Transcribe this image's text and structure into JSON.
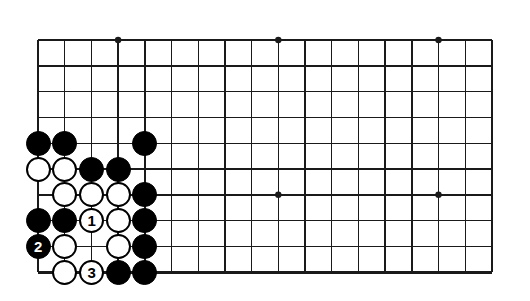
{
  "diagram": {
    "kind": "go-board-problem-diagram",
    "title": "",
    "board": {
      "cols": 18,
      "rows": 10,
      "spacing_x": 26.7,
      "spacing_y": 25.8,
      "origin_x": 38,
      "origin_y": 40,
      "edges": {
        "left": true,
        "top": true,
        "right": true,
        "bottom": true
      },
      "line_color": "#1a1a1a",
      "thin_line_width": 1.4,
      "edge_line_width": 2.6,
      "background": "#ffffff"
    },
    "star_points": [
      {
        "col": 3,
        "row": 0
      },
      {
        "col": 9,
        "row": 0
      },
      {
        "col": 15,
        "row": 0
      },
      {
        "col": 3,
        "row": 6
      },
      {
        "col": 9,
        "row": 6
      },
      {
        "col": 15,
        "row": 6
      }
    ],
    "stone_radius": 12.5,
    "stones": [
      {
        "col": 0,
        "row": 4,
        "color": "black",
        "label": ""
      },
      {
        "col": 1,
        "row": 4,
        "color": "black",
        "label": ""
      },
      {
        "col": 4,
        "row": 4,
        "color": "black",
        "label": ""
      },
      {
        "col": 0,
        "row": 5,
        "color": "white",
        "label": ""
      },
      {
        "col": 1,
        "row": 5,
        "color": "white",
        "label": ""
      },
      {
        "col": 2,
        "row": 5,
        "color": "black",
        "label": ""
      },
      {
        "col": 3,
        "row": 5,
        "color": "black",
        "label": ""
      },
      {
        "col": 1,
        "row": 6,
        "color": "white",
        "label": ""
      },
      {
        "col": 2,
        "row": 6,
        "color": "white",
        "label": ""
      },
      {
        "col": 3,
        "row": 6,
        "color": "white",
        "label": ""
      },
      {
        "col": 4,
        "row": 6,
        "color": "black",
        "label": ""
      },
      {
        "col": 0,
        "row": 7,
        "color": "black",
        "label": ""
      },
      {
        "col": 1,
        "row": 7,
        "color": "black",
        "label": ""
      },
      {
        "col": 2,
        "row": 7,
        "color": "white",
        "label": "1"
      },
      {
        "col": 3,
        "row": 7,
        "color": "white",
        "label": ""
      },
      {
        "col": 4,
        "row": 7,
        "color": "black",
        "label": ""
      },
      {
        "col": 0,
        "row": 8,
        "color": "black",
        "label": "2"
      },
      {
        "col": 1,
        "row": 8,
        "color": "white",
        "label": ""
      },
      {
        "col": 3,
        "row": 8,
        "color": "white",
        "label": ""
      },
      {
        "col": 4,
        "row": 8,
        "color": "black",
        "label": ""
      },
      {
        "col": 1,
        "row": 9,
        "color": "white",
        "label": ""
      },
      {
        "col": 2,
        "row": 9,
        "color": "white",
        "label": "3"
      },
      {
        "col": 3,
        "row": 9,
        "color": "black",
        "label": ""
      },
      {
        "col": 4,
        "row": 9,
        "color": "black",
        "label": ""
      }
    ],
    "move_numbers": [
      {
        "number": "1",
        "color": "white"
      },
      {
        "number": "2",
        "color": "black"
      },
      {
        "number": "3",
        "color": "white"
      }
    ]
  }
}
